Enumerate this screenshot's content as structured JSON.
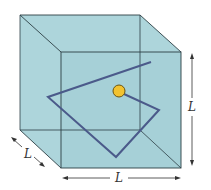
{
  "diagram": {
    "colors": {
      "box_fill": "#a9d3d9",
      "box_edge": "#2c3e44",
      "path": "#4b5a8a",
      "ball_fill": "#f2c230",
      "ball_edge": "#6b5410",
      "arrow": "#333333"
    },
    "labels": {
      "height": "L",
      "width": "L",
      "depth": "L"
    }
  }
}
